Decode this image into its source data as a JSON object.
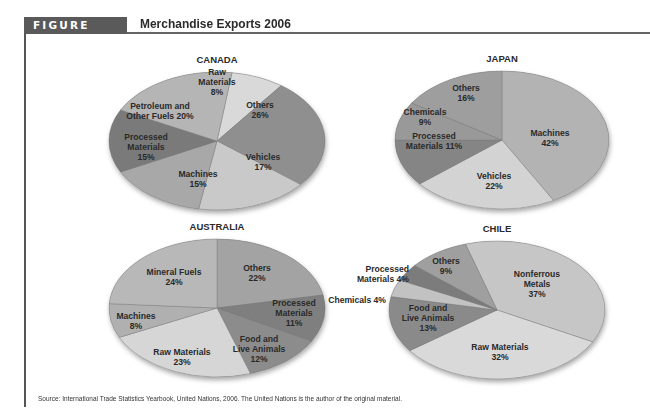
{
  "figure": {
    "label": "FIGURE 13.1",
    "title": "Merchandise Exports 2006",
    "source": "Source: International Trade Statistics Yearbook, United Nations, 2006. The United Nations is the author of the original material."
  },
  "chart_data": [
    {
      "type": "pie",
      "title": "CANADA",
      "cx": 217,
      "cy": 141,
      "rx": 108,
      "ry": 69,
      "start_angle": -82,
      "slices": [
        {
          "label": [
            "Raw",
            "Materials",
            "8%"
          ],
          "value": 8,
          "color": "#d9d9d9",
          "lx": 217,
          "ly": 82
        },
        {
          "label": [
            "Others",
            "26%"
          ],
          "value": 26,
          "color": "#8f8f8f",
          "lx": 260,
          "ly": 110
        },
        {
          "label": [
            "Vehicles",
            "17%"
          ],
          "value": 17,
          "color": "#c9c9c9",
          "lx": 263,
          "ly": 162
        },
        {
          "label": [
            "Machines",
            "15%"
          ],
          "value": 15,
          "color": "#a8a8a8",
          "lx": 198,
          "ly": 179
        },
        {
          "label": [
            "Processed",
            "Materials",
            "15%"
          ],
          "value": 15,
          "color": "#7a7a7a",
          "lx": 146,
          "ly": 147
        },
        {
          "label": [
            "Petroleum and",
            "Other Fuels 20%"
          ],
          "value": 20,
          "color": "#b5b5b5",
          "lx": 160,
          "ly": 111
        }
      ]
    },
    {
      "type": "pie",
      "title": "JAPAN",
      "cx": 502,
      "cy": 140,
      "rx": 107,
      "ry": 69,
      "start_angle": -90,
      "slices": [
        {
          "label": [
            "Machines",
            "42%"
          ],
          "value": 42,
          "color": "#b3b3b3",
          "lx": 550,
          "ly": 138
        },
        {
          "label": [
            "Vehicles",
            "22%"
          ],
          "value": 22,
          "color": "#d3d3d3",
          "lx": 494,
          "ly": 181
        },
        {
          "label": [
            "Processed",
            "Materials 11%"
          ],
          "value": 11,
          "color": "#858585",
          "lx": 434,
          "ly": 141
        },
        {
          "label": [
            "Chemicals",
            "9%"
          ],
          "value": 9,
          "color": "#999999",
          "lx": 425,
          "ly": 117
        },
        {
          "label": [
            "Others",
            "16%"
          ],
          "value": 16,
          "color": "#9e9e9e",
          "lx": 466,
          "ly": 93
        }
      ]
    },
    {
      "type": "pie",
      "title": "AUSTRALIA",
      "cx": 217,
      "cy": 308,
      "rx": 108,
      "ry": 69,
      "start_angle": -90,
      "slices": [
        {
          "label": [
            "Others",
            "22%"
          ],
          "value": 22,
          "color": "#a3a3a3",
          "lx": 257,
          "ly": 273
        },
        {
          "label": [
            "Processed",
            "Materials",
            "11%"
          ],
          "value": 11,
          "color": "#7f7f7f",
          "lx": 294,
          "ly": 313
        },
        {
          "label": [
            "Food and",
            "Live Animals",
            "12%"
          ],
          "value": 12,
          "color": "#8c8c8c",
          "lx": 259,
          "ly": 349
        },
        {
          "label": [
            "Raw Materials",
            "23%"
          ],
          "value": 23,
          "color": "#d6d6d6",
          "lx": 182,
          "ly": 357
        },
        {
          "label": [
            "Machines",
            "8%"
          ],
          "value": 8,
          "color": "#b0b0b0",
          "lx": 136,
          "ly": 321
        },
        {
          "label": [
            "Mineral Fuels",
            "24%"
          ],
          "value": 24,
          "color": "#b8b8b8",
          "lx": 174,
          "ly": 277
        }
      ]
    },
    {
      "type": "pie",
      "title": "CHILE",
      "cx": 497,
      "cy": 310,
      "rx": 108,
      "ry": 69,
      "start_angle": -107,
      "slices": [
        {
          "label": [
            "Nonferrous",
            "Metals",
            "37%"
          ],
          "value": 37,
          "color": "#c6c6c6",
          "lx": 537,
          "ly": 284
        },
        {
          "label": [
            "Raw Materials",
            "32%"
          ],
          "value": 32,
          "color": "#d9d9d9",
          "lx": 500,
          "ly": 352
        },
        {
          "label": [
            "Food and",
            "Live Animals",
            "13%"
          ],
          "value": 13,
          "color": "#8a8a8a",
          "lx": 428,
          "ly": 318
        },
        {
          "label": [
            "Chemicals 4%"
          ],
          "value": 4,
          "color": "#c2c2c2",
          "lx": 386,
          "ly": 300,
          "anchor": "end"
        },
        {
          "label": [
            "Processed",
            "Materials 4%"
          ],
          "value": 4,
          "color": "#7c7c7c",
          "lx": 409,
          "ly": 274,
          "anchor": "end"
        },
        {
          "label": [
            "Others",
            "9%"
          ],
          "value": 9,
          "color": "#9f9f9f",
          "lx": 446,
          "ly": 266
        }
      ]
    }
  ]
}
